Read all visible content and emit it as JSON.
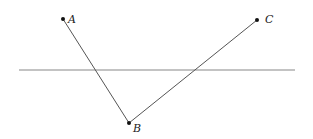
{
  "diagram": {
    "points": [
      {
        "label": "A",
        "x": 63,
        "y": 19
      },
      {
        "label": "B",
        "x": 129,
        "y": 123
      },
      {
        "label": "C",
        "x": 257,
        "y": 20
      }
    ],
    "line": {
      "x1": 19,
      "y1": 70,
      "x2": 295,
      "y2": 70
    },
    "segments": [
      [
        "A",
        "B"
      ],
      [
        "B",
        "C"
      ]
    ],
    "colors": {
      "line": "#777777",
      "segment": "#555555",
      "point": "#111111"
    }
  }
}
